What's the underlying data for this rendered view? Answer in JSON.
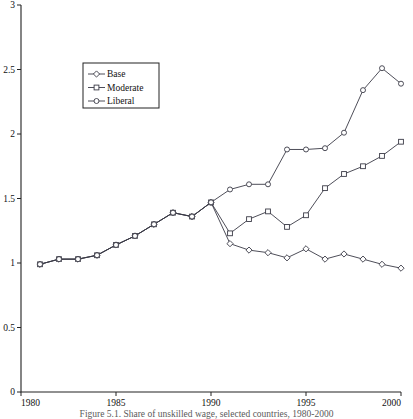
{
  "figure": {
    "caption": "Figure 5.1. Share of unskilled wage, selected countries, 1980-2000"
  },
  "legend": {
    "position": "upper-left-inside",
    "entries": [
      {
        "label": "Base",
        "marker": "diamond-marker-icon"
      },
      {
        "label": "Moderate",
        "marker": "square-marker-icon"
      },
      {
        "label": "Liberal",
        "marker": "circle-marker-icon"
      }
    ]
  },
  "axes": {
    "x_ticks": [
      "1980",
      "1985",
      "1990",
      "1995",
      "2000"
    ],
    "y_ticks": [
      "0",
      "0.5",
      "1",
      "1.5",
      "2",
      "2.5",
      "3"
    ]
  },
  "chart_data": {
    "type": "line",
    "title": "",
    "subtitle": "",
    "xlabel": "",
    "ylabel": "",
    "xlim": [
      1980,
      2000
    ],
    "ylim": [
      0,
      3
    ],
    "xticks": [
      1980,
      1985,
      1990,
      1995,
      2000
    ],
    "yticks": [
      0,
      0.5,
      1,
      1.5,
      2,
      2.5,
      3
    ],
    "grid": false,
    "legend_position": "upper left",
    "x": [
      1981,
      1982,
      1983,
      1984,
      1985,
      1986,
      1987,
      1988,
      1989,
      1990,
      1991,
      1992,
      1993,
      1994,
      1995,
      1996,
      1997,
      1998,
      1999,
      2000
    ],
    "series": [
      {
        "name": "Base",
        "marker": "diamond",
        "values": [
          0.99,
          1.03,
          1.03,
          1.06,
          1.14,
          1.21,
          1.3,
          1.39,
          1.36,
          1.47,
          1.15,
          1.1,
          1.08,
          1.04,
          1.11,
          1.03,
          1.07,
          1.03,
          0.99,
          0.96
        ]
      },
      {
        "name": "Moderate",
        "marker": "square",
        "values": [
          0.99,
          1.03,
          1.03,
          1.06,
          1.14,
          1.21,
          1.3,
          1.39,
          1.36,
          1.47,
          1.23,
          1.34,
          1.4,
          1.28,
          1.37,
          1.58,
          1.69,
          1.75,
          1.83,
          1.94
        ]
      },
      {
        "name": "Liberal",
        "marker": "circle",
        "values": [
          0.99,
          1.03,
          1.03,
          1.06,
          1.14,
          1.21,
          1.3,
          1.39,
          1.36,
          1.47,
          1.57,
          1.61,
          1.61,
          1.88,
          1.88,
          1.89,
          2.01,
          2.34,
          2.51,
          2.39
        ]
      }
    ]
  }
}
